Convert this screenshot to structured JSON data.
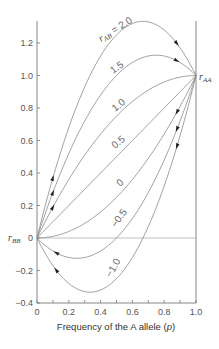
{
  "chart_data": {
    "type": "line",
    "title": "",
    "xlabel": "Frequency of the A allele (p)",
    "ylabel": "",
    "xlim": [
      0,
      1.0
    ],
    "ylim": [
      -0.4,
      1.35
    ],
    "x_ticks": [
      "0",
      "0.2",
      "0.4",
      "0.6",
      "0.8",
      "1.0"
    ],
    "y_ticks": [
      "-0.4",
      "-0.2",
      "0",
      "0.2",
      "0.4",
      "0.6",
      "0.8",
      "1.0",
      "1.2"
    ],
    "grid": false,
    "legend": "inline curve labels",
    "formula": "y = p^2 + 2 * r_AB * p * (1 - p)",
    "endpoint_labels": {
      "left": "r_BB",
      "right": "r_AA"
    },
    "series_label_prefix": "r_AB =",
    "x": [
      0,
      0.1,
      0.2,
      0.3,
      0.4,
      0.5,
      0.6,
      0.7,
      0.8,
      0.9,
      1.0
    ],
    "series": [
      {
        "name": "r_AB = 2.0",
        "label": "2.0",
        "values": [
          0,
          0.37,
          0.68,
          0.93,
          1.12,
          1.25,
          1.32,
          1.33,
          1.28,
          1.17,
          1.0
        ]
      },
      {
        "name": "r_AB = 1.5",
        "label": "1.5",
        "values": [
          0,
          0.28,
          0.52,
          0.72,
          0.88,
          1.0,
          1.08,
          1.12,
          1.12,
          1.08,
          1.0
        ]
      },
      {
        "name": "r_AB = 1.0",
        "label": "1.0",
        "values": [
          0,
          0.19,
          0.36,
          0.51,
          0.64,
          0.75,
          0.84,
          0.91,
          0.96,
          0.99,
          1.0
        ]
      },
      {
        "name": "r_AB = 0.5",
        "label": "0.5",
        "values": [
          0,
          0.1,
          0.2,
          0.3,
          0.4,
          0.5,
          0.6,
          0.7,
          0.8,
          0.9,
          1.0
        ]
      },
      {
        "name": "r_AB = 0",
        "label": "0",
        "values": [
          0,
          0.01,
          0.04,
          0.09,
          0.16,
          0.25,
          0.36,
          0.49,
          0.64,
          0.81,
          1.0
        ]
      },
      {
        "name": "r_AB = -0.5",
        "label": "-0.5",
        "values": [
          0,
          -0.08,
          -0.12,
          -0.12,
          -0.08,
          0,
          0.12,
          0.28,
          0.48,
          0.72,
          1.0
        ]
      },
      {
        "name": "r_AB = -1.0",
        "label": "-1.0",
        "values": [
          0,
          -0.17,
          -0.28,
          -0.33,
          -0.32,
          -0.25,
          -0.12,
          0.07,
          0.32,
          0.63,
          1.0
        ]
      }
    ],
    "arrows": [
      {
        "series": "r_AB = 2.0",
        "direction": "toward p=1",
        "near_p": 0.1
      },
      {
        "series": "r_AB = 1.5",
        "direction": "toward p=1",
        "near_p": 0.1
      },
      {
        "series": "r_AB = 1.0",
        "direction": "toward p=1",
        "near_p": 0.1
      },
      {
        "series": "r_AB = 2.0",
        "direction": "toward p=1",
        "near_p": 0.88
      },
      {
        "series": "r_AB = 1.5",
        "direction": "toward p=1",
        "near_p": 0.88
      },
      {
        "series": "r_AB = 0",
        "direction": "toward p=0",
        "near_p": 0.88
      },
      {
        "series": "r_AB = -0.5",
        "direction": "toward p=0",
        "near_p": 0.88
      },
      {
        "series": "r_AB = -1.0",
        "direction": "toward p=0",
        "near_p": 0.88
      },
      {
        "series": "r_AB = -0.5",
        "direction": "toward p=0",
        "near_p": 0.12
      },
      {
        "series": "r_AB = -1.0",
        "direction": "toward p=0",
        "near_p": 0.12
      }
    ],
    "reference_lines": [
      {
        "type": "horizontal",
        "y": 0
      },
      {
        "type": "vertical",
        "x": 1.0
      }
    ]
  },
  "labels": {
    "xlabel_prefix": "Frequency of the A allele (",
    "xlabel_var": "p",
    "xlabel_suffix": ")",
    "r": "r",
    "sub_AA": "AA",
    "sub_BB": "BB",
    "sub_AB": "AB",
    "eq": " = 2.0",
    "c15": "1.5",
    "c10": "1.0",
    "c05": "0.5",
    "c0": "0",
    "cm05": "−0.5",
    "cm10": "−1.0"
  }
}
